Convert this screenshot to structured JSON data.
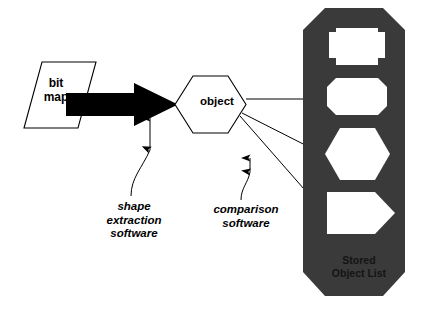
{
  "diagram": {
    "colors": {
      "background": "#ffffff",
      "stroke": "#000000",
      "arrow_fill": "#000000",
      "panel_fill": "#3a3a3a",
      "panel_text": "#141414",
      "shape_fill": "#ffffff"
    }
  },
  "nodes": {
    "bitmap": {
      "label": "bit\nmap",
      "shape": "parallelogram"
    },
    "object": {
      "label": "object",
      "shape": "hexagon"
    }
  },
  "annotations": [
    {
      "id": "shape-extraction",
      "label": "shape\nextraction\nsoftware",
      "points_to": "thick-arrow"
    },
    {
      "id": "comparison",
      "label": "comparison\nsoftware",
      "points_to": "connector-lines"
    }
  ],
  "panel": {
    "label": "Stored\nObject List",
    "shape": "octagon",
    "items": [
      {
        "id": "stored-shape-1",
        "shape": "notched-rectangle"
      },
      {
        "id": "stored-shape-2",
        "shape": "octagon"
      },
      {
        "id": "stored-shape-3",
        "shape": "hexagon"
      },
      {
        "id": "stored-shape-4",
        "shape": "right-arrow-pentagon"
      }
    ]
  },
  "connectors": [
    {
      "id": "bitmap-to-object",
      "style": "thick-block-arrow"
    },
    {
      "id": "object-to-shape-1",
      "style": "thin-line-arrow"
    },
    {
      "id": "object-to-shape-3",
      "style": "thin-line-arrow"
    },
    {
      "id": "object-to-shape-4",
      "style": "thin-line-arrow"
    }
  ]
}
